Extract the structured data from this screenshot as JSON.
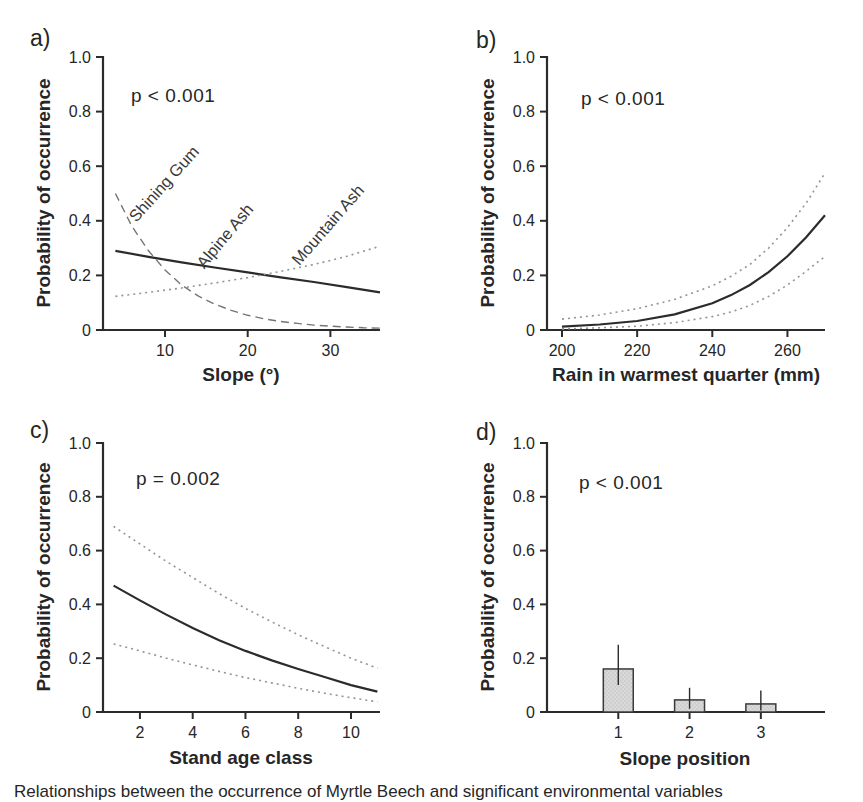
{
  "figure": {
    "caption_partial": "Relationships between the occurrence of Myrtle Beech and significant environmental variables",
    "background": "#ffffff",
    "text_color": "#262626",
    "axis_color": "#2b2b2b",
    "solid_line_color": "#2b2b2b",
    "dashed_line_color": "#757575",
    "dotted_line_color": "#949494",
    "bar_fill": "#d9d9d9",
    "bar_stroke": "#3a3a3a"
  },
  "chart_data": [
    {
      "id": "a",
      "panel_label": "a)",
      "type": "line",
      "p_value": "p < 0.001",
      "xlabel": "Slope (°)",
      "ylabel": "Probability of occurrence",
      "xlim": [
        2.5,
        36
      ],
      "ylim": [
        0,
        1
      ],
      "xticks": [
        10,
        20,
        30
      ],
      "xtick_labels": [
        "10",
        "20",
        "30"
      ],
      "yticks": [
        0,
        0.2,
        0.4,
        0.6,
        0.8,
        1.0
      ],
      "ytick_labels": [
        "0",
        "0.2",
        "0.4",
        "0.6",
        "0.8",
        "1.0"
      ],
      "grid": false,
      "series": [
        {
          "name": "Shining Gum",
          "style": "dashed",
          "points": [
            [
              4,
              0.5
            ],
            [
              6,
              0.38
            ],
            [
              8,
              0.29
            ],
            [
              10,
              0.22
            ],
            [
              12,
              0.165
            ],
            [
              14,
              0.125
            ],
            [
              16,
              0.095
            ],
            [
              18,
              0.072
            ],
            [
              20,
              0.054
            ],
            [
              22,
              0.041
            ],
            [
              24,
              0.031
            ],
            [
              26,
              0.024
            ],
            [
              28,
              0.018
            ],
            [
              30,
              0.014
            ],
            [
              32,
              0.011
            ],
            [
              34,
              0.008
            ],
            [
              36,
              0.007
            ]
          ]
        },
        {
          "name": "Alpine Ash",
          "style": "solid",
          "points": [
            [
              4,
              0.29
            ],
            [
              8,
              0.268
            ],
            [
              12,
              0.248
            ],
            [
              16,
              0.229
            ],
            [
              20,
              0.211
            ],
            [
              24,
              0.193
            ],
            [
              28,
              0.176
            ],
            [
              32,
              0.157
            ],
            [
              36,
              0.138
            ]
          ]
        },
        {
          "name": "Mountain Ash",
          "style": "dotted",
          "points": [
            [
              4,
              0.123
            ],
            [
              8,
              0.138
            ],
            [
              12,
              0.154
            ],
            [
              16,
              0.172
            ],
            [
              20,
              0.192
            ],
            [
              24,
              0.215
            ],
            [
              28,
              0.24
            ],
            [
              32,
              0.27
            ],
            [
              36,
              0.307
            ]
          ]
        }
      ]
    },
    {
      "id": "b",
      "panel_label": "b)",
      "type": "line",
      "p_value": "p < 0.001",
      "xlabel": "Rain in warmest quarter (mm)",
      "ylabel": "Probability of occurrence",
      "xlim": [
        196,
        270
      ],
      "ylim": [
        0,
        1
      ],
      "xticks": [
        200,
        220,
        240,
        260
      ],
      "xtick_labels": [
        "200",
        "220",
        "240",
        "260"
      ],
      "yticks": [
        0,
        0.2,
        0.4,
        0.6,
        0.8,
        1.0
      ],
      "ytick_labels": [
        "0",
        "0.2",
        "0.4",
        "0.6",
        "0.8",
        "1.0"
      ],
      "grid": false,
      "series": [
        {
          "name": "upper 95% CI",
          "style": "dotted",
          "points": [
            [
              200,
              0.04
            ],
            [
              210,
              0.055
            ],
            [
              220,
              0.078
            ],
            [
              230,
              0.112
            ],
            [
              240,
              0.162
            ],
            [
              245,
              0.197
            ],
            [
              250,
              0.24
            ],
            [
              255,
              0.3
            ],
            [
              260,
              0.375
            ],
            [
              265,
              0.465
            ],
            [
              270,
              0.575
            ]
          ]
        },
        {
          "name": "fitted",
          "style": "solid",
          "points": [
            [
              200,
              0.012
            ],
            [
              210,
              0.02
            ],
            [
              220,
              0.033
            ],
            [
              230,
              0.057
            ],
            [
              240,
              0.098
            ],
            [
              245,
              0.128
            ],
            [
              250,
              0.165
            ],
            [
              255,
              0.212
            ],
            [
              260,
              0.27
            ],
            [
              265,
              0.34
            ],
            [
              270,
              0.42
            ]
          ]
        },
        {
          "name": "lower 95% CI",
          "style": "dotted",
          "points": [
            [
              200,
              0.004
            ],
            [
              210,
              0.008
            ],
            [
              220,
              0.014
            ],
            [
              230,
              0.027
            ],
            [
              240,
              0.049
            ],
            [
              245,
              0.066
            ],
            [
              250,
              0.09
            ],
            [
              255,
              0.123
            ],
            [
              260,
              0.165
            ],
            [
              265,
              0.215
            ],
            [
              270,
              0.27
            ]
          ]
        }
      ]
    },
    {
      "id": "c",
      "panel_label": "c)",
      "type": "line",
      "p_value": "p = 0.002",
      "xlabel": "Stand age class",
      "ylabel": "Probability of occurrence",
      "xlim": [
        0.6,
        11.1
      ],
      "ylim": [
        0,
        1
      ],
      "xticks": [
        2,
        4,
        6,
        8,
        10
      ],
      "xtick_labels": [
        "2",
        "4",
        "6",
        "8",
        "10"
      ],
      "yticks": [
        0,
        0.2,
        0.4,
        0.6,
        0.8,
        1.0
      ],
      "ytick_labels": [
        "0",
        "0.2",
        "0.4",
        "0.6",
        "0.8",
        "1.0"
      ],
      "grid": false,
      "series": [
        {
          "name": "upper 95% CI",
          "style": "dotted",
          "points": [
            [
              1,
              0.69
            ],
            [
              2,
              0.625
            ],
            [
              3,
              0.56
            ],
            [
              4,
              0.5
            ],
            [
              5,
              0.44
            ],
            [
              6,
              0.385
            ],
            [
              7,
              0.335
            ],
            [
              8,
              0.287
            ],
            [
              9,
              0.243
            ],
            [
              10,
              0.2
            ],
            [
              11,
              0.163
            ]
          ]
        },
        {
          "name": "fitted",
          "style": "solid",
          "points": [
            [
              1,
              0.47
            ],
            [
              2,
              0.415
            ],
            [
              3,
              0.362
            ],
            [
              4,
              0.312
            ],
            [
              5,
              0.267
            ],
            [
              6,
              0.227
            ],
            [
              7,
              0.192
            ],
            [
              8,
              0.16
            ],
            [
              9,
              0.13
            ],
            [
              10,
              0.1
            ],
            [
              11,
              0.076
            ]
          ]
        },
        {
          "name": "lower 95% CI",
          "style": "dotted",
          "points": [
            [
              1,
              0.253
            ],
            [
              2,
              0.227
            ],
            [
              3,
              0.2
            ],
            [
              4,
              0.175
            ],
            [
              5,
              0.151
            ],
            [
              6,
              0.128
            ],
            [
              7,
              0.108
            ],
            [
              8,
              0.088
            ],
            [
              9,
              0.07
            ],
            [
              10,
              0.053
            ],
            [
              11,
              0.038
            ]
          ]
        }
      ]
    },
    {
      "id": "d",
      "panel_label": "d)",
      "type": "bar",
      "p_value": "p < 0.001",
      "xlabel": "Slope position",
      "ylabel": "Probability of occurrence",
      "xlim": [
        0,
        3.9
      ],
      "ylim": [
        0,
        1
      ],
      "xticks": [
        1,
        2,
        3
      ],
      "xtick_labels": [
        "1",
        "2",
        "3"
      ],
      "yticks": [
        0,
        0.2,
        0.4,
        0.6,
        0.8,
        1.0
      ],
      "ytick_labels": [
        "0",
        "0.2",
        "0.4",
        "0.6",
        "0.8",
        "1.0"
      ],
      "grid": false,
      "categories": [
        "1",
        "2",
        "3"
      ],
      "values": [
        0.16,
        0.045,
        0.03
      ],
      "error_low": [
        0.1,
        0.012,
        0.006
      ],
      "error_high": [
        0.25,
        0.09,
        0.08
      ],
      "bar_width": 0.42
    }
  ]
}
